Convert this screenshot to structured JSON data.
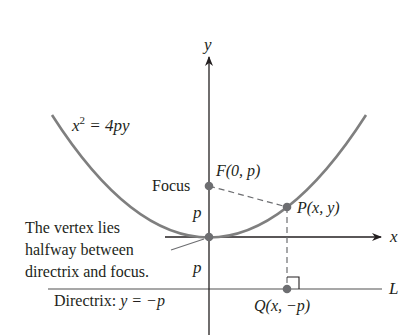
{
  "diagram": {
    "equation": {
      "base": "x",
      "exp": "2",
      "rest": " = 4py"
    },
    "axes": {
      "x_label": "x",
      "y_label": "y"
    },
    "focus": {
      "label": "Focus",
      "point": "F(0, p)"
    },
    "point_p": "P(x, y)",
    "point_q": "Q(x, −p)",
    "directrix_line_label": "L",
    "directrix_label": {
      "prefix": "Directrix: ",
      "eq": "y = −p"
    },
    "distance_label_upper": "p",
    "distance_label_lower": "p",
    "vertex_note": [
      "The vertex lies",
      "halfway between",
      "directrix and focus."
    ],
    "colors": {
      "curve": "#7a7a7a",
      "axis": "#231f20",
      "dot": "#6d6e71",
      "dash": "#6d6e71"
    }
  }
}
